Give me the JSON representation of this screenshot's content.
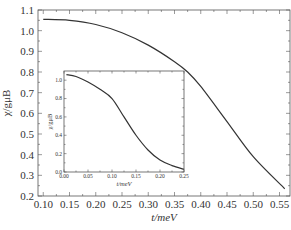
{
  "chart_data": [
    {
      "id": "main",
      "type": "line",
      "title": "",
      "xlabel": "t/meV",
      "ylabel": "χ/gμB",
      "xlim": [
        0.09,
        0.57
      ],
      "ylim": [
        0.2,
        1.1
      ],
      "xticks": [
        0.1,
        0.15,
        0.2,
        0.25,
        0.3,
        0.35,
        0.4,
        0.45,
        0.5,
        0.55
      ],
      "xtick_labels": [
        "0.10",
        "0.15",
        "0.20",
        "0.25",
        "0.30",
        "0.35",
        "0.40",
        "0.45",
        "0.50",
        "0.55"
      ],
      "yticks": [
        0.2,
        0.3,
        0.4,
        0.5,
        0.6,
        0.7,
        0.8,
        0.9,
        1.0,
        1.1
      ],
      "ytick_labels": [
        "0.2",
        "0.3",
        "0.4",
        "0.5",
        "0.6",
        "0.7",
        "0.8",
        "0.9",
        "1.0",
        "1.1"
      ],
      "grid": false,
      "legend": "none",
      "series": [
        {
          "name": "chi",
          "x": [
            0.1,
            0.15,
            0.2,
            0.25,
            0.3,
            0.35,
            0.375,
            0.4,
            0.45,
            0.5,
            0.56
          ],
          "y": [
            1.055,
            1.05,
            1.03,
            0.99,
            0.93,
            0.85,
            0.8,
            0.73,
            0.56,
            0.39,
            0.235
          ]
        }
      ]
    },
    {
      "id": "inset",
      "type": "line",
      "title": "",
      "xlabel": "t/meV",
      "ylabel": "χ/gμB",
      "xlim": [
        0.0,
        0.25
      ],
      "ylim": [
        0.0,
        1.1
      ],
      "xticks": [
        0.0,
        0.05,
        0.1,
        0.15,
        0.2,
        0.25
      ],
      "xtick_labels": [
        "0.00",
        "0.05",
        "0.10",
        "0.15",
        "0.20",
        "0.25"
      ],
      "yticks": [
        0.0,
        0.2,
        0.4,
        0.6,
        0.8,
        1.0
      ],
      "ytick_labels": [
        "0.0",
        "0.2",
        "0.4",
        "0.6",
        "0.8",
        "1.0"
      ],
      "grid": false,
      "legend": "none",
      "series": [
        {
          "name": "chi",
          "x": [
            0.005,
            0.025,
            0.05,
            0.075,
            0.1,
            0.125,
            0.15,
            0.175,
            0.2,
            0.225,
            0.25
          ],
          "y": [
            1.06,
            1.04,
            0.98,
            0.9,
            0.8,
            0.6,
            0.4,
            0.24,
            0.13,
            0.07,
            0.03
          ]
        }
      ]
    }
  ]
}
